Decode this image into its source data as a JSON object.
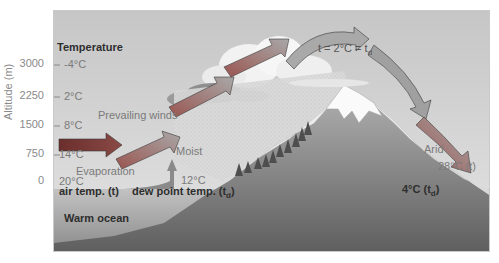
{
  "diagram": {
    "axis_title": "Altitude (m)",
    "temperature_header": "Temperature",
    "altitudes": [
      {
        "alt": "3000",
        "temp": "-4°C"
      },
      {
        "alt": "2250",
        "temp": "2°C"
      },
      {
        "alt": "1500",
        "temp": "8°C"
      },
      {
        "alt": "750",
        "temp": "14°C"
      },
      {
        "alt": "0",
        "temp": "20°C"
      }
    ],
    "labels": {
      "prevailing_winds": "Prevailing winds",
      "evaporation": "Evaporation",
      "moist": "Moist",
      "dew_point_start": "12°C",
      "air_temp": "air temp. (t)",
      "dew_point_temp": "dew point temp. (t",
      "dew_point_sub": "d",
      "dew_point_close": ")",
      "warm_ocean": "Warm ocean",
      "summit": "t = 2°C = t",
      "summit_sub": "d",
      "arid": "Arid",
      "leeward_air": "28°C (t)",
      "leeward_dew": "4°C (t",
      "leeward_dew_sub": "d",
      "leeward_dew_close": ")"
    },
    "colors": {
      "sky": "#d4d4d4",
      "ocean": "#9a9a9a",
      "mountain_light": "#eeeeee",
      "ground_dark": "#6e6e6e",
      "arrow_red": "#8a3a36",
      "arrow_grey": "#9c9c9c"
    }
  }
}
